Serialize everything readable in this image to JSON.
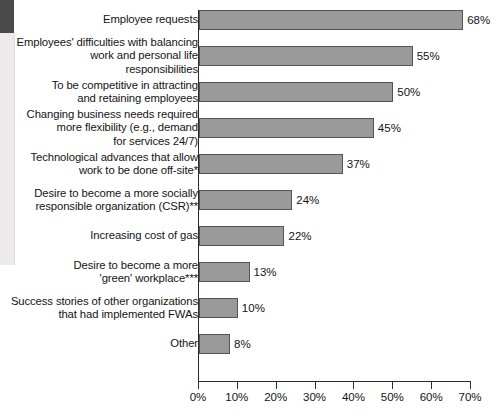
{
  "chart_data": {
    "type": "bar",
    "orientation": "horizontal",
    "title": "",
    "subtitle": "",
    "xlabel": "",
    "ylabel": "",
    "xlim": [
      0,
      70
    ],
    "grid": false,
    "legend": null,
    "value_suffix": "%",
    "xticks": [
      "0%",
      "10%",
      "20%",
      "30%",
      "40%",
      "50%",
      "60%",
      "70%"
    ],
    "xtick_values": [
      0,
      10,
      20,
      30,
      40,
      50,
      60,
      70
    ],
    "categories": [
      "Employee requests",
      "Employees' difficulties with balancing\nwork and personal life\nresponsibilities",
      "To be competitive in attracting\nand retaining employees",
      "Changing business needs required\nmore flexibility (e.g., demand\nfor services 24/7)",
      "Technological advances that allow\nwork to be done off-site*",
      "Desire to become a more socially\nresponsible organization (CSR)**",
      "Increasing cost of gas",
      "Desire to become a more\n'green' workplace***",
      "Success stories of other organizations\nthat had implemented FWAs",
      "Other"
    ],
    "values": [
      68,
      55,
      50,
      45,
      37,
      24,
      22,
      13,
      10,
      8
    ],
    "value_labels": [
      "68%",
      "55%",
      "50%",
      "45%",
      "37%",
      "24%",
      "22%",
      "13%",
      "10%",
      "8%"
    ],
    "colors": {
      "bar_fill": "#9a9a9a",
      "bar_border": "#555555",
      "axis": "#2a2a2a",
      "text": "#141414",
      "background": "#ffffff"
    }
  }
}
